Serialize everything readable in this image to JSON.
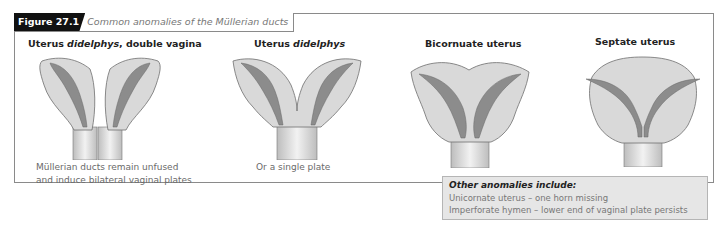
{
  "figure": {
    "label": "Figure 27.1",
    "title": "Common anomalies of the Müllerian ducts"
  },
  "panels": [
    {
      "heading_main": "Uterus ",
      "heading_italic": "didelphys",
      "heading_rest": ", double vagina",
      "caption_lines": [
        "Müllerian ducts remain unfused",
        "and induce bilateral vaginal plates"
      ]
    },
    {
      "heading_main": "Uterus ",
      "heading_italic": "didelphys",
      "heading_rest": "",
      "caption_lines": [
        "Or a single plate"
      ]
    },
    {
      "heading_main": "Bicornuate uterus",
      "heading_italic": "",
      "heading_rest": "",
      "caption_lines": []
    },
    {
      "heading_main": "Septate uterus",
      "heading_italic": "",
      "heading_rest": "",
      "caption_lines": []
    }
  ],
  "other_anomalies": {
    "title": "Other anomalies include:",
    "items": [
      "Unicornate uterus – one horn missing",
      "Imperforate hymen – lower end of vaginal plate persists"
    ]
  },
  "colors": {
    "header_label_bg": "#111111",
    "tissue": "#d9d9d9",
    "cavity": "#8c8c8c",
    "note_bg": "#e6e6e6"
  }
}
